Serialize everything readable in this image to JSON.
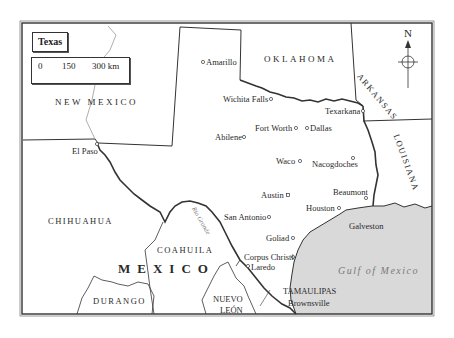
{
  "map": {
    "title": "Texas",
    "scale": {
      "ticks": [
        "0",
        "150",
        "300 km"
      ]
    },
    "compass": {
      "label": "N"
    },
    "regions": {
      "new_mexico": "NEW MEXICO",
      "oklahoma": "OKLAHOMA",
      "arkansas": "ARKANSAS",
      "louisiana": "LOUISIANA",
      "chihuahua": "CHIHUAHUA",
      "coahuila": "COAHUILA",
      "durango": "DURANGO",
      "nuevo_leon_1": "NUEVO",
      "nuevo_leon_2": "LEÓN",
      "tamaulipas": "TAMAULIPAS",
      "mexico": "MEXICO"
    },
    "water": {
      "gulf": "Gulf of Mexico",
      "river": "Rio Grande"
    },
    "cities": [
      {
        "name": "Amarillo"
      },
      {
        "name": "Wichita Falls"
      },
      {
        "name": "Texarkana"
      },
      {
        "name": "Fort Worth"
      },
      {
        "name": "Dallas"
      },
      {
        "name": "Abilene"
      },
      {
        "name": "El Paso"
      },
      {
        "name": "Waco"
      },
      {
        "name": "Nacogdoches"
      },
      {
        "name": "Beaumont"
      },
      {
        "name": "Austin"
      },
      {
        "name": "Houston"
      },
      {
        "name": "San Antonio"
      },
      {
        "name": "Galveston"
      },
      {
        "name": "Goliad"
      },
      {
        "name": "Corpus Christi"
      },
      {
        "name": "Laredo"
      },
      {
        "name": "Brownsville"
      }
    ],
    "colors": {
      "gulf": "#d9d9d9",
      "land": "#ffffff",
      "border": "#333333"
    }
  }
}
